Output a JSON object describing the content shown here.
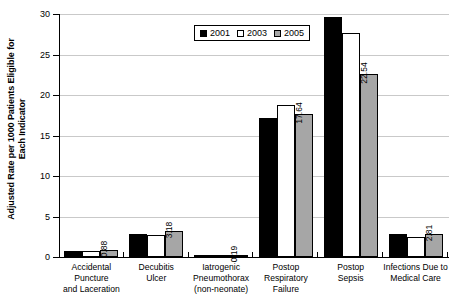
{
  "chart_data": {
    "type": "bar",
    "title": "",
    "xlabel": "",
    "ylabel_line1": "Adjusted Rate per 1000 Patients Eligible for",
    "ylabel_line2": "Each Indicator",
    "ylim": [
      0,
      30
    ],
    "yticks": [
      0,
      5,
      10,
      15,
      20,
      25,
      30
    ],
    "ytick_labels": [
      "0",
      "5",
      "10",
      "15",
      "20",
      "25",
      "30"
    ],
    "grid": true,
    "legend_position": "top-center",
    "categories": [
      {
        "lines": [
          "Accidental Puncture",
          "and Laceration"
        ]
      },
      {
        "lines": [
          "Decubitis",
          "Ulcer"
        ]
      },
      {
        "lines": [
          "Iatrogenic",
          "Pneumothorax",
          "(non-neonate)"
        ]
      },
      {
        "lines": [
          "Postop Respiratory",
          "Failure"
        ]
      },
      {
        "lines": [
          "Postop",
          "Sepsis"
        ]
      },
      {
        "lines": [
          "Infections Due to",
          "Medical Care"
        ]
      }
    ],
    "series": [
      {
        "name": "2001",
        "color": "#000000",
        "values": [
          0.78,
          2.9,
          0.16,
          17.2,
          29.6,
          2.78
        ]
      },
      {
        "name": "2003",
        "color": "#ffffff",
        "values": [
          0.72,
          2.68,
          0.22,
          18.8,
          27.6,
          2.5
        ]
      },
      {
        "name": "2005",
        "color": "#a6a6a6",
        "values": [
          0.88,
          3.18,
          0.19,
          17.64,
          22.54,
          2.81
        ]
      }
    ],
    "annotations": [
      {
        "category": "Accidental Puncture and Laceration",
        "series": "2005",
        "text": "0.88"
      },
      {
        "category": "Decubitis Ulcer",
        "series": "2005",
        "text": "3.18"
      },
      {
        "category": "Iatrogenic Pneumothorax (non-neonate)",
        "series": "2005",
        "text": "0.19"
      },
      {
        "category": "Postop Respiratory Failure",
        "series": "2005",
        "text": "17.64"
      },
      {
        "category": "Postop Sepsis",
        "series": "2005",
        "text": "22.54"
      },
      {
        "category": "Infections Due to Medical Care",
        "series": "2005",
        "text": "2.81"
      }
    ]
  }
}
